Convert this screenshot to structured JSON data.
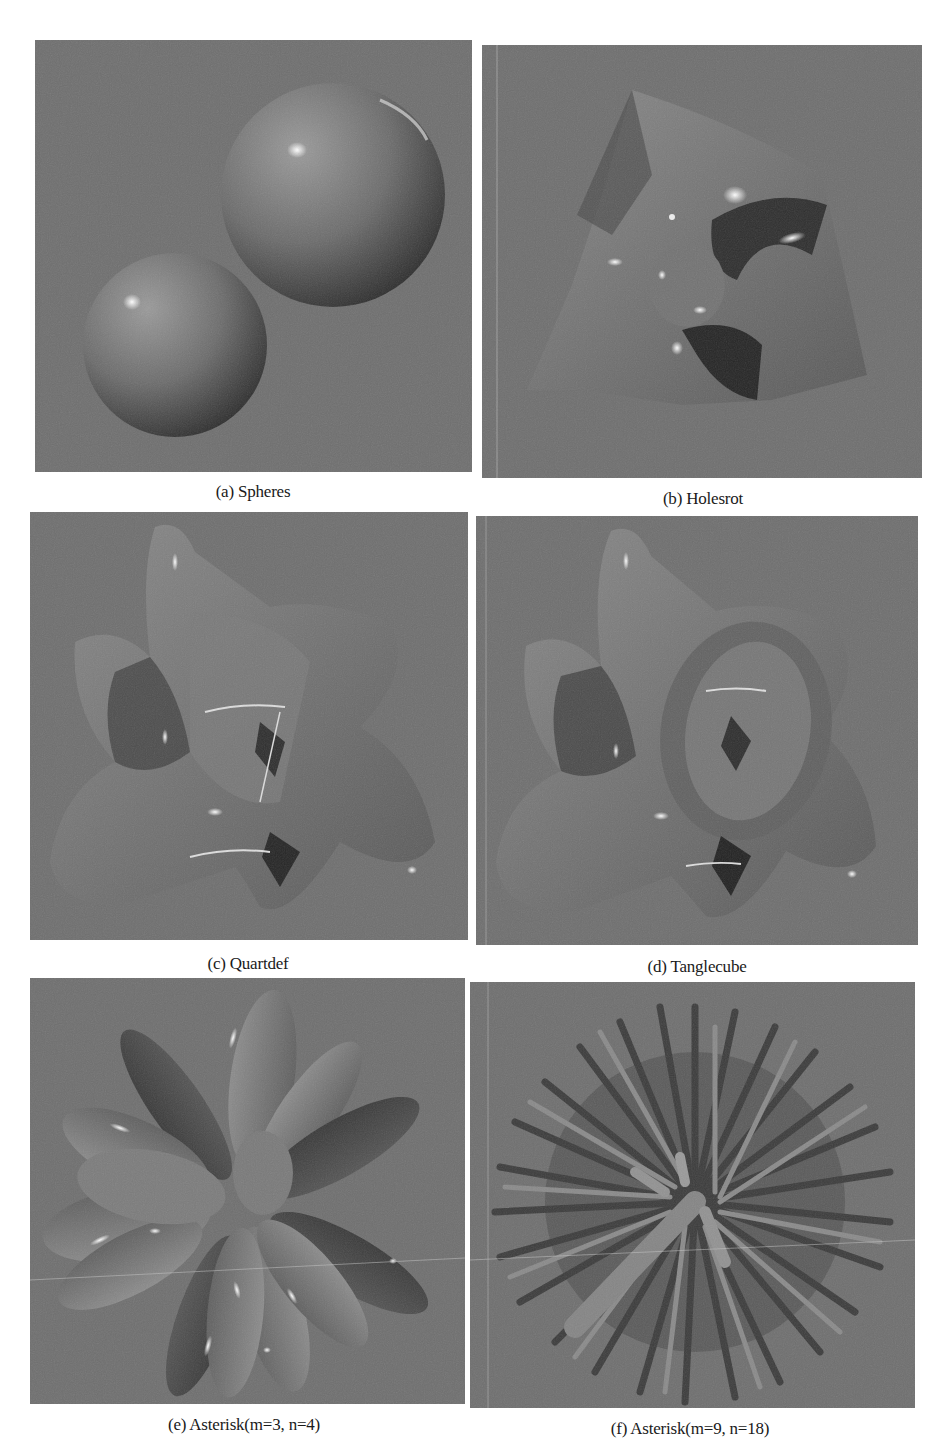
{
  "figure": {
    "background_color": "#ffffff",
    "panel_background_color": "#6f6f6f",
    "panels": [
      {
        "id": "a",
        "caption": "(a) Spheres",
        "subject": "two shaded spheres"
      },
      {
        "id": "b",
        "caption": "(b) Holesrot",
        "subject": "implicit surface with holes, rotated"
      },
      {
        "id": "c",
        "caption": "(c) Quartdef",
        "subject": "quartic deformed surface"
      },
      {
        "id": "d",
        "caption": "(d) Tanglecube",
        "subject": "tanglecube implicit surface"
      },
      {
        "id": "e",
        "caption": "(e) Asterisk(m=3, n=4)",
        "subject": "asterisk surface with petals"
      },
      {
        "id": "f",
        "caption": "(f) Asterisk(m=9, n=18)",
        "subject": "asterisk surface with many spikes"
      }
    ]
  }
}
